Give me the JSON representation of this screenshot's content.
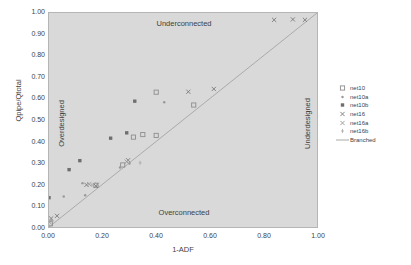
{
  "chart_data": {
    "type": "scatter",
    "title": "",
    "xlabel": "1-ADF",
    "ylabel": "Qpipe/Qtotal",
    "xlim": [
      0.0,
      1.0
    ],
    "ylim": [
      0.0,
      1.0
    ],
    "grid": false,
    "legend_position": "right",
    "xticks": [
      "0.00",
      "0.20",
      "0.40",
      "0.60",
      "0.80",
      "1.00"
    ],
    "xtick_values": [
      0.0,
      0.2,
      0.4,
      0.6,
      0.8,
      1.0
    ],
    "yticks": [
      "0.00",
      "0.10",
      "0.20",
      "0.30",
      "0.40",
      "0.50",
      "0.60",
      "0.70",
      "0.80",
      "0.90",
      "1.00"
    ],
    "ytick_values": [
      0.0,
      0.1,
      0.2,
      0.3,
      0.4,
      0.5,
      0.6,
      0.7,
      0.8,
      0.9,
      1.0
    ],
    "annotations": [
      {
        "text": "Underconnected",
        "position": "top-center",
        "rotation": 0
      },
      {
        "text": "Overconnected",
        "position": "bottom-center",
        "rotation": 0
      },
      {
        "text": "Overdesigned",
        "position": "left-inside",
        "rotation": -90
      },
      {
        "text": "Underdesigned",
        "position": "right-inside",
        "rotation": -90
      }
    ],
    "series": [
      {
        "name": "net10",
        "marker": "open-square",
        "color": "#8d8d8d",
        "points": [
          [
            0.005,
            0.015
          ],
          [
            0.175,
            0.195
          ],
          [
            0.275,
            0.29
          ],
          [
            0.315,
            0.42
          ],
          [
            0.35,
            0.432
          ],
          [
            0.4,
            0.428
          ],
          [
            0.4,
            0.63
          ],
          [
            0.54,
            0.57
          ]
        ]
      },
      {
        "name": "net10a",
        "marker": "small-dot",
        "color": "#9a9a9a",
        "points": [
          [
            0.01,
            0.03
          ],
          [
            0.055,
            0.143
          ],
          [
            0.125,
            0.205
          ],
          [
            0.135,
            0.148
          ],
          [
            0.265,
            0.278
          ],
          [
            0.3,
            0.297
          ],
          [
            0.43,
            0.583
          ]
        ]
      },
      {
        "name": "net10b",
        "marker": "filled-square",
        "color": "#6e6e6e",
        "points": [
          [
            0.0,
            0.137
          ],
          [
            0.075,
            0.268
          ],
          [
            0.115,
            0.31
          ],
          [
            0.23,
            0.415
          ],
          [
            0.29,
            0.44
          ],
          [
            0.32,
            0.588
          ]
        ]
      },
      {
        "name": "net16",
        "marker": "x-cross",
        "color": "#7d7d7d",
        "points": [
          [
            0.008,
            0.04
          ],
          [
            0.03,
            0.052
          ],
          [
            0.14,
            0.197
          ],
          [
            0.175,
            0.192
          ],
          [
            0.295,
            0.312
          ],
          [
            0.52,
            0.632
          ],
          [
            0.615,
            0.645
          ],
          [
            0.84,
            0.968
          ],
          [
            0.91,
            0.97
          ],
          [
            0.955,
            0.968
          ]
        ]
      },
      {
        "name": "net16a",
        "marker": "x-cross",
        "color": "#9b9b9b",
        "points": [
          [
            0.002,
            0.022
          ],
          [
            0.15,
            0.2
          ],
          [
            0.18,
            0.198
          ],
          [
            0.29,
            0.305
          ]
        ]
      },
      {
        "name": "net16b",
        "marker": "tick",
        "color": "#a8a8a8",
        "points": [
          [
            0.0,
            0.005
          ],
          [
            0.012,
            0.028
          ],
          [
            0.16,
            0.196
          ],
          [
            0.34,
            0.3
          ]
        ]
      },
      {
        "name": "Branched",
        "marker": "line",
        "color": "#9e9e9e",
        "is_line": true,
        "line": [
          [
            0.0,
            0.0
          ],
          [
            1.0,
            1.0
          ]
        ]
      }
    ]
  },
  "legend": {
    "entries": [
      {
        "label": "net10"
      },
      {
        "label": "net10a"
      },
      {
        "label": "net10b"
      },
      {
        "label": "net16"
      },
      {
        "label": "net16a"
      },
      {
        "label": "net16b"
      },
      {
        "label": "Branched"
      }
    ]
  },
  "axes": {
    "x_title": "1-ADF",
    "y_title": "Qpipe/Qtotal"
  },
  "colors": {
    "plot_background": "#d9d9d9",
    "page_background": "#ffffff",
    "text": "#3f3f3f",
    "frame": "#b5b5b5",
    "reference_line": "#9e9e9e"
  }
}
